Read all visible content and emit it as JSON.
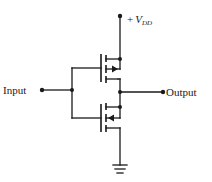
{
  "diagram": {
    "labels": {
      "supply_prefix": "+",
      "supply_symbol": "V",
      "supply_subscript": "DD",
      "input": "Input",
      "output": "Output"
    },
    "components": [
      {
        "id": "pmos",
        "type": "p-channel MOSFET",
        "position": "upper",
        "arrow": "out"
      },
      {
        "id": "nmos",
        "type": "n-channel MOSFET",
        "position": "lower",
        "arrow": "in"
      },
      {
        "id": "ground",
        "type": "ground symbol"
      }
    ],
    "nodes": [
      "+VDD",
      "Input",
      "Output",
      "Ground"
    ],
    "colors": {
      "ink": "#1a1a1a",
      "background": "#ffffff"
    }
  }
}
